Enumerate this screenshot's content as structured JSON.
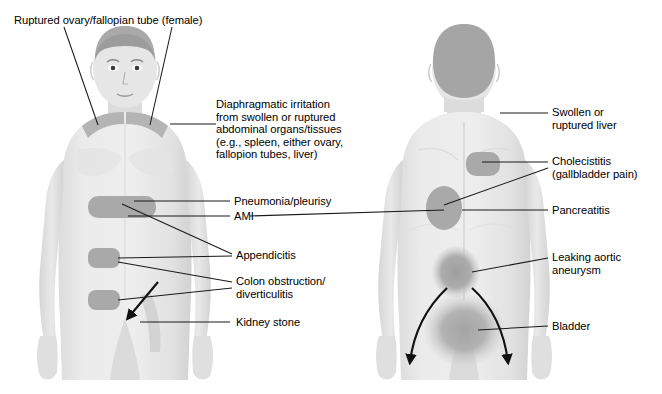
{
  "figure": {
    "title_implied": "Referred pain patterns — anterior and posterior views",
    "views": [
      {
        "name": "anterior",
        "label": "anterior body view"
      },
      {
        "name": "posterior",
        "label": "posterior body view"
      }
    ]
  },
  "colors": {
    "background": "#ffffff",
    "skin_light": "#e9e9e9",
    "skin_shadow": "#d8d8d8",
    "hair_dark": "#a8a8a8",
    "pain_patch": "#a9a9a9",
    "pain_patch_soft": "#b0b0b0",
    "line": "#1a1a1a",
    "text": "#000000"
  },
  "labels": {
    "ruptured_ovary": "Ruptured ovary/fallopian tube (female)",
    "diaphragmatic": "Diaphragmatic irritation\nfrom swollen or ruptured\nabdominal organs/tissues\n(e.g., spleen, either ovary,\nfallopion tubes, liver)",
    "pneumonia": "Pneumonia/pleurisy",
    "ami": "AMI",
    "appendicitis": "Appendicitis",
    "colon": "Colon obstruction/\ndiverticulitis",
    "kidney_stone": "Kidney stone",
    "swollen_liver": "Swollen or\nruptured liver",
    "cholecistitis": "Cholecistitis\n(gallbladder pain)",
    "pancreatitis": "Pancreatitis",
    "aortic": "Leaking aortic\naneurysm",
    "bladder": "Bladder"
  },
  "pain_sites": {
    "anterior": [
      {
        "name": "left-shoulder-referred",
        "shape": "shoulder-shade"
      },
      {
        "name": "right-shoulder-referred",
        "shape": "shoulder-shade"
      },
      {
        "name": "epigastric-band",
        "shape": "rounded-rect"
      },
      {
        "name": "periumbilical-patch",
        "shape": "rounded-rect"
      },
      {
        "name": "lower-left-quadrant-patch",
        "shape": "rounded-rect"
      }
    ],
    "posterior": [
      {
        "name": "upper-back-scapular-patch",
        "shape": "rounded-rect"
      },
      {
        "name": "mid-back-oval",
        "shape": "oval"
      },
      {
        "name": "lumbar-oval",
        "shape": "oval"
      },
      {
        "name": "sacral-buttock-oval",
        "shape": "large-soft-oval"
      }
    ],
    "arrows": [
      {
        "name": "kidney-stone-radiation-arrow",
        "view": "anterior",
        "direction": "down-left-to-groin"
      },
      {
        "name": "bladder-radiation-arrow-left",
        "view": "posterior",
        "direction": "down-left"
      },
      {
        "name": "bladder-radiation-arrow-right",
        "view": "posterior",
        "direction": "down-right"
      }
    ]
  }
}
